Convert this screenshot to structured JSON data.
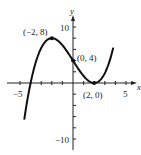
{
  "chart_data": {
    "type": "line",
    "title": "",
    "xlabel": "x",
    "ylabel": "y",
    "xlim": [
      -5.2,
      5.2
    ],
    "ylim": [
      -11,
      11
    ],
    "x_ticks": [
      -5,
      -4,
      -3,
      -2,
      -1,
      1,
      2,
      3,
      4,
      5
    ],
    "y_ticks": [
      -10,
      -8,
      -6,
      -4,
      -2,
      2,
      4,
      6,
      8,
      10
    ],
    "x_tick_labels": {
      "-5": "−5",
      "5": "5"
    },
    "y_tick_labels": {
      "10": "10",
      "-10": "−10"
    },
    "grid": false,
    "function": "f(x) = (x - 2)^2 (x + 4) / 4",
    "series": [
      {
        "name": "f(x)",
        "x": [
          -4.6,
          -4,
          -3,
          -2,
          -1,
          0,
          1,
          2,
          3,
          3.8
        ],
        "values": [
          -9.0,
          0,
          6.25,
          8,
          6.75,
          4,
          1.25,
          0,
          1.75,
          7.0
        ]
      }
    ],
    "points": [
      {
        "x": -2,
        "y": 8,
        "label": "(−2, 8)"
      },
      {
        "x": 0,
        "y": 4,
        "label": "(0, 4)"
      },
      {
        "x": 2,
        "y": 0,
        "label": "(2, 0)"
      }
    ]
  },
  "labels": {
    "x_axis": "x",
    "y_axis": "y",
    "x_min": "−5",
    "x_max": "5",
    "y_max": "10",
    "y_min": "−10",
    "p1": "(−2, 8)",
    "p2": "(0, 4)",
    "p3": "(2, 0)"
  }
}
